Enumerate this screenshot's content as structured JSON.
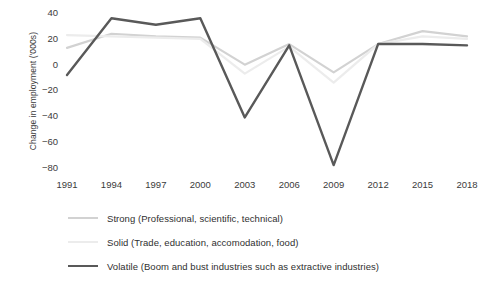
{
  "chart_data": {
    "type": "line",
    "title": "",
    "xlabel": "",
    "ylabel": "Change in employment ('000s)",
    "x": [
      1991,
      1994,
      1997,
      2000,
      2003,
      2006,
      2009,
      2012,
      2015,
      2018
    ],
    "xtick_labels": [
      "1991",
      "1994",
      "1997",
      "2000",
      "2003",
      "2006",
      "2009",
      "2012",
      "2015",
      "2018"
    ],
    "ytick_labels": [
      "40",
      "20",
      "0",
      "−20",
      "−40",
      "−60",
      "−80"
    ],
    "ytick_values": [
      40,
      20,
      0,
      -20,
      -40,
      -60,
      -80
    ],
    "ylim": [
      -88,
      44
    ],
    "xlim": [
      1991,
      2018
    ],
    "grid": false,
    "legend_position": "below",
    "series": [
      {
        "name": "Strong (Professional, scientific, technical)",
        "color": "#d2d2d2",
        "width": 2.2,
        "values": [
          13,
          24,
          22,
          21,
          0,
          16,
          -6,
          16,
          26,
          22
        ]
      },
      {
        "name": "Solid (Trade, education, accomodation, food)",
        "color": "#ececec",
        "width": 2.2,
        "values": [
          23,
          22,
          21,
          20,
          -7,
          14,
          -14,
          16,
          22,
          20
        ]
      },
      {
        "name": "Volatile (Boom and bust industries such as extractive industries)",
        "color": "#595959",
        "width": 2.4,
        "values": [
          -8,
          36,
          31,
          36,
          -41,
          15,
          -78,
          16,
          16,
          15
        ]
      }
    ]
  },
  "legend": {
    "items": [
      {
        "label": "Strong (Professional, scientific, technical)",
        "color": "#d2d2d2",
        "width": 2.2
      },
      {
        "label": "Solid (Trade, education, accomodation, food)",
        "color": "#ececec",
        "width": 2.2
      },
      {
        "label": "Volatile (Boom and bust industries such as extractive industries)",
        "color": "#595959",
        "width": 2.8
      }
    ]
  }
}
